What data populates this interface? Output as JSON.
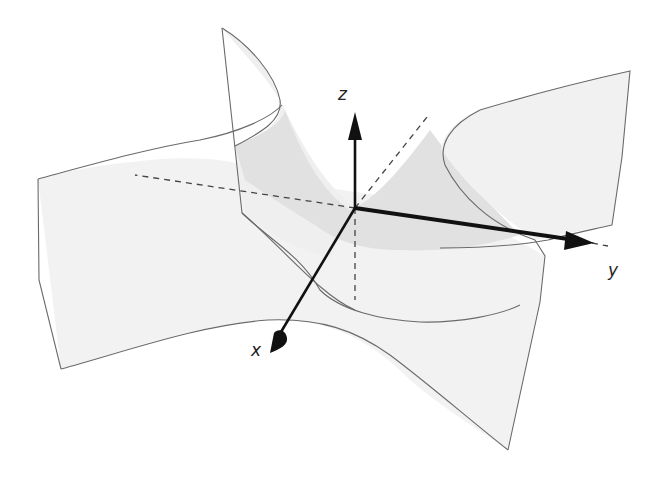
{
  "diagram": {
    "type": "saddle-surface-3d",
    "axes": {
      "x": {
        "label": "x"
      },
      "y": {
        "label": "y"
      },
      "z": {
        "label": "z"
      }
    },
    "colors": {
      "surface_light": "#f1f1f1",
      "surface_shaded": "#e2e2e2",
      "edge": "#6a6a6a",
      "axis": "#111111",
      "dashed": "#444444",
      "background": "#ffffff"
    }
  }
}
